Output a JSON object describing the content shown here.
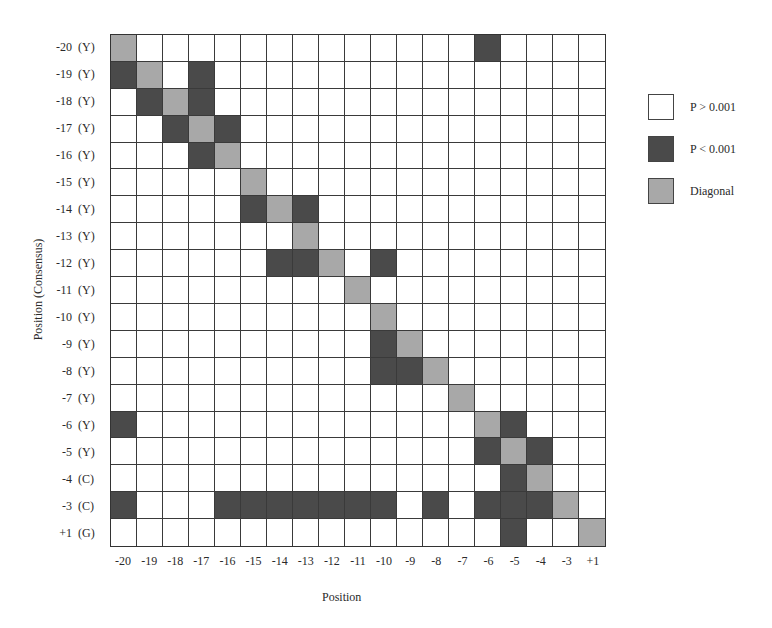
{
  "chart_data": {
    "type": "heatmap",
    "title": "",
    "xlabel": "Position",
    "ylabel": "Position (Consensus)",
    "x_categories": [
      "-20",
      "-19",
      "-18",
      "-17",
      "-16",
      "-15",
      "-14",
      "-13",
      "-12",
      "-11",
      "-10",
      "-9",
      "-8",
      "-7",
      "-6",
      "-5",
      "-4",
      "-3",
      "+1"
    ],
    "y_categories": [
      {
        "pos": "-20",
        "aa": "(Y)"
      },
      {
        "pos": "-19",
        "aa": "(Y)"
      },
      {
        "pos": "-18",
        "aa": "(Y)"
      },
      {
        "pos": "-17",
        "aa": "(Y)"
      },
      {
        "pos": "-16",
        "aa": "(Y)"
      },
      {
        "pos": "-15",
        "aa": "(Y)"
      },
      {
        "pos": "-14",
        "aa": "(Y)"
      },
      {
        "pos": "-13",
        "aa": "(Y)"
      },
      {
        "pos": "-12",
        "aa": "(Y)"
      },
      {
        "pos": "-11",
        "aa": "(Y)"
      },
      {
        "pos": "-10",
        "aa": "(Y)"
      },
      {
        "pos": "-9",
        "aa": "(Y)"
      },
      {
        "pos": "-8",
        "aa": "(Y)"
      },
      {
        "pos": "-7",
        "aa": "(Y)"
      },
      {
        "pos": "-6",
        "aa": "(Y)"
      },
      {
        "pos": "-5",
        "aa": "(Y)"
      },
      {
        "pos": "-4",
        "aa": "(C)"
      },
      {
        "pos": "-3",
        "aa": "(C)"
      },
      {
        "pos": "+1",
        "aa": "(G)"
      }
    ],
    "value_legend": {
      "0": "P > 0.001",
      "1": "P < 0.001",
      "2": "Diagonal"
    },
    "matrix": [
      [
        2,
        0,
        0,
        0,
        0,
        0,
        0,
        0,
        0,
        0,
        0,
        0,
        0,
        0,
        1,
        0,
        0,
        0,
        0
      ],
      [
        1,
        2,
        0,
        1,
        0,
        0,
        0,
        0,
        0,
        0,
        0,
        0,
        0,
        0,
        0,
        0,
        0,
        0,
        0
      ],
      [
        0,
        1,
        2,
        1,
        0,
        0,
        0,
        0,
        0,
        0,
        0,
        0,
        0,
        0,
        0,
        0,
        0,
        0,
        0
      ],
      [
        0,
        0,
        1,
        2,
        1,
        0,
        0,
        0,
        0,
        0,
        0,
        0,
        0,
        0,
        0,
        0,
        0,
        0,
        0
      ],
      [
        0,
        0,
        0,
        1,
        2,
        0,
        0,
        0,
        0,
        0,
        0,
        0,
        0,
        0,
        0,
        0,
        0,
        0,
        0
      ],
      [
        0,
        0,
        0,
        0,
        0,
        2,
        0,
        0,
        0,
        0,
        0,
        0,
        0,
        0,
        0,
        0,
        0,
        0,
        0
      ],
      [
        0,
        0,
        0,
        0,
        0,
        1,
        2,
        1,
        0,
        0,
        0,
        0,
        0,
        0,
        0,
        0,
        0,
        0,
        0
      ],
      [
        0,
        0,
        0,
        0,
        0,
        0,
        0,
        2,
        0,
        0,
        0,
        0,
        0,
        0,
        0,
        0,
        0,
        0,
        0
      ],
      [
        0,
        0,
        0,
        0,
        0,
        0,
        1,
        1,
        2,
        0,
        1,
        0,
        0,
        0,
        0,
        0,
        0,
        0,
        0
      ],
      [
        0,
        0,
        0,
        0,
        0,
        0,
        0,
        0,
        0,
        2,
        0,
        0,
        0,
        0,
        0,
        0,
        0,
        0,
        0
      ],
      [
        0,
        0,
        0,
        0,
        0,
        0,
        0,
        0,
        0,
        0,
        2,
        0,
        0,
        0,
        0,
        0,
        0,
        0,
        0
      ],
      [
        0,
        0,
        0,
        0,
        0,
        0,
        0,
        0,
        0,
        0,
        1,
        2,
        0,
        0,
        0,
        0,
        0,
        0,
        0
      ],
      [
        0,
        0,
        0,
        0,
        0,
        0,
        0,
        0,
        0,
        0,
        1,
        1,
        2,
        0,
        0,
        0,
        0,
        0,
        0
      ],
      [
        0,
        0,
        0,
        0,
        0,
        0,
        0,
        0,
        0,
        0,
        0,
        0,
        0,
        2,
        0,
        0,
        0,
        0,
        0
      ],
      [
        1,
        0,
        0,
        0,
        0,
        0,
        0,
        0,
        0,
        0,
        0,
        0,
        0,
        0,
        2,
        1,
        0,
        0,
        0
      ],
      [
        0,
        0,
        0,
        0,
        0,
        0,
        0,
        0,
        0,
        0,
        0,
        0,
        0,
        0,
        1,
        2,
        1,
        0,
        0
      ],
      [
        0,
        0,
        0,
        0,
        0,
        0,
        0,
        0,
        0,
        0,
        0,
        0,
        0,
        0,
        0,
        1,
        2,
        0,
        0
      ],
      [
        1,
        0,
        0,
        0,
        1,
        1,
        1,
        1,
        1,
        1,
        1,
        0,
        1,
        0,
        1,
        1,
        1,
        2,
        0
      ],
      [
        0,
        0,
        0,
        0,
        0,
        0,
        0,
        0,
        0,
        0,
        0,
        0,
        0,
        0,
        0,
        1,
        0,
        0,
        2
      ]
    ],
    "grid": true,
    "legend_position": "right"
  },
  "legend": {
    "items": [
      {
        "label": "P > 0.001",
        "color": "#ffffff"
      },
      {
        "label": "P < 0.001",
        "color": "#4a4a4a"
      },
      {
        "label": "Diagonal",
        "color": "#a8a8a8"
      }
    ]
  }
}
